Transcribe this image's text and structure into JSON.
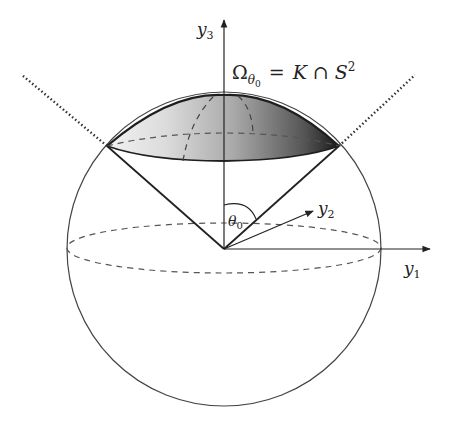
{
  "figure": {
    "title_label": {
      "omega": "Ω",
      "omega_sub": "θ",
      "omega_subsub": "0",
      "equals": "=",
      "K": "K",
      "cap": "∩",
      "S": "S",
      "S_sup": "2"
    },
    "axes": {
      "y1": {
        "base": "y",
        "sub": "1"
      },
      "y2": {
        "base": "y",
        "sub": "2"
      },
      "y3": {
        "base": "y",
        "sub": "3"
      }
    },
    "angle_label": {
      "base": "θ",
      "sub": "0"
    },
    "colors": {
      "stroke": "#2a2a2a",
      "dashed": "#555555",
      "cap_light": "#f4f4f4",
      "cap_dark": "#1e1e1e"
    }
  }
}
